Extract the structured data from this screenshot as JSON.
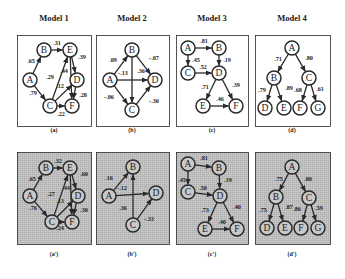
{
  "titles": [
    "Model 1",
    "Model 2",
    "Model 3",
    "Model 4"
  ],
  "captions": {
    "top": [
      "(a)",
      "(b)",
      "(c)",
      "(d)"
    ],
    "bottom": [
      "(a')",
      "(b')",
      "(c')",
      "(d')"
    ]
  },
  "colors": {
    "stroke": "#2a2a2a",
    "panel_top_bg": "#ffffff",
    "panel_bottom_bg": "#bdbdbd",
    "node_fill_top": "#ffffff",
    "node_fill_bottom": "#c8c8c8"
  },
  "panels": [
    {
      "id": "a",
      "row": "top",
      "box": [
        17,
        35,
        74,
        91
      ],
      "nodes": {
        "B": [
          44,
          50
        ],
        "E": [
          70,
          50
        ],
        "A": [
          30,
          80
        ],
        "D": [
          77,
          80
        ],
        "C": [
          50,
          106
        ],
        "F": [
          72,
          106
        ]
      },
      "edges": [
        {
          "from": "A",
          "to": "B",
          "w": ".65",
          "lx": 31,
          "ly": 63
        },
        {
          "from": "B",
          "to": "E",
          "w": ".31",
          "lx": 57,
          "ly": 45
        },
        {
          "from": "E",
          "to": "D",
          "w": ".39",
          "lx": 82,
          "ly": 59
        },
        {
          "from": "A",
          "to": "C",
          "w": ".79",
          "lx": 33,
          "ly": 95
        },
        {
          "from": "C",
          "to": "E",
          "w": ".29",
          "lx": 50,
          "ly": 79
        },
        {
          "from": "E",
          "to": "F",
          "w": ".44",
          "lx": 64,
          "ly": 73
        },
        {
          "from": "C",
          "to": "D",
          "w": ".12",
          "lx": 60,
          "ly": 88
        },
        {
          "from": "D",
          "to": "F",
          "w": ".28",
          "lx": 83,
          "ly": 97
        },
        {
          "from": "C",
          "to": "F",
          "w": ".22",
          "lx": 61,
          "ly": 116
        }
      ]
    },
    {
      "id": "b",
      "row": "top",
      "box": [
        96,
        35,
        73,
        91
      ],
      "nodes": {
        "B": [
          132,
          50
        ],
        "A": [
          110,
          80
        ],
        "D": [
          155,
          80
        ],
        "C": [
          132,
          110
        ]
      },
      "edges": [
        {
          "from": "A",
          "to": "B",
          "w": ".09",
          "lx": 113,
          "ly": 62
        },
        {
          "from": "B",
          "to": "D",
          "w": "-.07",
          "lx": 154,
          "ly": 60
        },
        {
          "from": "A",
          "to": "D",
          "w": "-.13",
          "lx": 123,
          "ly": 75
        },
        {
          "from": "B",
          "to": "C",
          "w": ".36",
          "lx": 141,
          "ly": 73
        },
        {
          "from": "A",
          "to": "C",
          "w": "-.06",
          "lx": 109,
          "ly": 99
        },
        {
          "from": "C",
          "to": "D",
          "w": "-.30",
          "lx": 154,
          "ly": 103
        }
      ]
    },
    {
      "id": "c",
      "row": "top",
      "box": [
        176,
        35,
        72,
        91
      ],
      "nodes": {
        "A": [
          188,
          48
        ],
        "B": [
          219,
          48
        ],
        "C": [
          188,
          73
        ],
        "D": [
          219,
          73
        ],
        "E": [
          203,
          106
        ],
        "F": [
          236,
          106
        ]
      },
      "edges": [
        {
          "from": "A",
          "to": "B",
          "w": ".81",
          "lx": 204,
          "ly": 43
        },
        {
          "from": "A",
          "to": "C",
          "w": ".45",
          "lx": 196,
          "ly": 62
        },
        {
          "from": "B",
          "to": "D",
          "w": ".19",
          "lx": 227,
          "ly": 62
        },
        {
          "from": "C",
          "to": "D",
          "w": ".52",
          "lx": 203,
          "ly": 69
        },
        {
          "from": "D",
          "to": "E",
          "w": ".71",
          "lx": 205,
          "ly": 89
        },
        {
          "from": "D",
          "to": "F",
          "w": ".39",
          "lx": 236,
          "ly": 87
        },
        {
          "from": "E",
          "to": "F",
          "w": ".46",
          "lx": 220,
          "ly": 101
        }
      ]
    },
    {
      "id": "d",
      "row": "top",
      "box": [
        255,
        35,
        75,
        91
      ],
      "nodes": {
        "A": [
          292,
          48
        ],
        "B": [
          274,
          78
        ],
        "C": [
          309,
          78
        ],
        "D": [
          265,
          108
        ],
        "E": [
          284,
          108
        ],
        "F": [
          300,
          108
        ],
        "G": [
          318,
          108
        ]
      },
      "edges": [
        {
          "from": "A",
          "to": "B",
          "w": ".71",
          "lx": 278,
          "ly": 61
        },
        {
          "from": "A",
          "to": "C",
          "w": ".80",
          "lx": 309,
          "ly": 60
        },
        {
          "from": "B",
          "to": "D",
          "w": ".79",
          "lx": 262,
          "ly": 92
        },
        {
          "from": "B",
          "to": "E",
          "w": ".89",
          "lx": 289,
          "ly": 90
        },
        {
          "from": "C",
          "to": "F",
          "w": ".68",
          "lx": 298,
          "ly": 92
        },
        {
          "from": "C",
          "to": "G",
          "w": ".61",
          "lx": 320,
          "ly": 91
        }
      ]
    },
    {
      "id": "a2",
      "row": "bottom",
      "box": [
        17,
        152,
        74,
        92
      ],
      "nodes": {
        "B": [
          46,
          168
        ],
        "E": [
          70,
          168
        ],
        "A": [
          30,
          196
        ],
        "D": [
          78,
          196
        ],
        "C": [
          52,
          222
        ],
        "F": [
          72,
          222
        ]
      },
      "edges": [
        {
          "from": "A",
          "to": "B",
          "w": ".65",
          "lx": 32,
          "ly": 181
        },
        {
          "from": "B",
          "to": "E",
          "w": ".32",
          "lx": 58,
          "ly": 163
        },
        {
          "from": "E",
          "to": "D",
          "w": ".60",
          "lx": 84,
          "ly": 176
        },
        {
          "from": "A",
          "to": "C",
          "w": ".76",
          "lx": 33,
          "ly": 210
        },
        {
          "from": "C",
          "to": "E",
          "w": ".27",
          "lx": 51,
          "ly": 196
        },
        {
          "from": "E",
          "to": "F",
          "w": ".44",
          "lx": 66,
          "ly": 190
        },
        {
          "from": "C",
          "to": "D",
          "w": ".13",
          "lx": 60,
          "ly": 203
        },
        {
          "from": "D",
          "to": "F",
          "w": ".30",
          "lx": 84,
          "ly": 212
        },
        {
          "from": "C",
          "to": "F",
          "w": ".24",
          "lx": 60,
          "ly": 230
        }
      ]
    },
    {
      "id": "b2",
      "row": "bottom",
      "box": [
        96,
        152,
        73,
        92
      ],
      "nodes": {
        "B": [
          133,
          167
        ],
        "A": [
          109,
          196
        ],
        "D": [
          156,
          193
        ],
        "C": [
          133,
          225
        ]
      },
      "edges": [
        {
          "from": "A",
          "to": "B",
          "w": ".16",
          "lx": 109,
          "ly": 180
        },
        {
          "from": "A",
          "to": "D",
          "w": "-.12",
          "lx": 122,
          "ly": 190
        },
        {
          "from": "C",
          "to": "B",
          "w": ".36",
          "lx": 123,
          "ly": 210
        },
        {
          "from": "C",
          "to": "D",
          "w": "-.33",
          "lx": 149,
          "ly": 221
        }
      ]
    },
    {
      "id": "c2",
      "row": "bottom",
      "box": [
        176,
        152,
        72,
        92
      ],
      "nodes": {
        "A": [
          188,
          164
        ],
        "B": [
          219,
          168
        ],
        "C": [
          188,
          192
        ],
        "D": [
          220,
          196
        ],
        "E": [
          205,
          229
        ],
        "F": [
          237,
          229
        ]
      },
      "edges": [
        {
          "from": "A",
          "to": "B",
          "w": ".81",
          "lx": 204,
          "ly": 160
        },
        {
          "from": "A",
          "to": "C",
          "w": ".45",
          "lx": 182,
          "ly": 182
        },
        {
          "from": "B",
          "to": "D",
          "w": ".19",
          "lx": 228,
          "ly": 182
        },
        {
          "from": "C",
          "to": "D",
          "w": ".50",
          "lx": 203,
          "ly": 190
        },
        {
          "from": "D",
          "to": "E",
          "w": ".73",
          "lx": 205,
          "ly": 212
        },
        {
          "from": "D",
          "to": "F",
          "w": ".40",
          "lx": 237,
          "ly": 209
        },
        {
          "from": "E",
          "to": "F",
          "w": ".40",
          "lx": 222,
          "ly": 224
        }
      ]
    },
    {
      "id": "d2",
      "row": "bottom",
      "box": [
        255,
        152,
        75,
        92
      ],
      "nodes": {
        "A": [
          292,
          167
        ],
        "B": [
          276,
          197
        ],
        "C": [
          309,
          198
        ],
        "D": [
          267,
          228
        ],
        "E": [
          285,
          228
        ],
        "F": [
          301,
          228
        ],
        "G": [
          318,
          228
        ]
      },
      "edges": [
        {
          "from": "A",
          "to": "B",
          "w": ".75",
          "lx": 279,
          "ly": 181
        },
        {
          "from": "A",
          "to": "C",
          "w": ".80",
          "lx": 308,
          "ly": 181
        },
        {
          "from": "B",
          "to": "D",
          "w": ".75",
          "lx": 263,
          "ly": 212
        },
        {
          "from": "B",
          "to": "E",
          "w": ".87",
          "lx": 289,
          "ly": 209
        },
        {
          "from": "C",
          "to": "F",
          "w": ".86",
          "lx": 297,
          "ly": 211
        },
        {
          "from": "C",
          "to": "G",
          "w": ".59",
          "lx": 319,
          "ly": 210
        }
      ]
    }
  ],
  "layout": {
    "title_y": 18,
    "title_x": [
      54,
      132,
      212,
      292
    ],
    "caption_top_y": 130,
    "caption_bottom_y": 254,
    "caption_x": [
      54,
      132,
      212,
      292
    ]
  }
}
